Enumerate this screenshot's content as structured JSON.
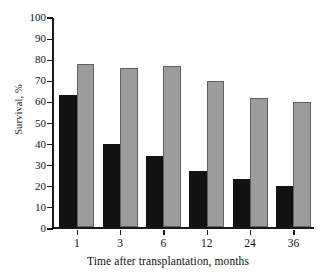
{
  "chart_data": {
    "type": "bar",
    "title": "",
    "xlabel": "Time after transplantation, months",
    "ylabel": "Survival, %",
    "categories": [
      "1",
      "3",
      "6",
      "12",
      "24",
      "36"
    ],
    "series": [
      {
        "name": "dark",
        "color": "#121212",
        "values": [
          63,
          40,
          34,
          27,
          23,
          20
        ]
      },
      {
        "name": "light",
        "color": "#9b9c9b",
        "values": [
          78,
          76,
          77,
          70,
          62,
          60
        ]
      }
    ],
    "ylim": [
      0,
      100
    ],
    "yticks": [
      100,
      90,
      80,
      70,
      60,
      50,
      40,
      30,
      20,
      10,
      0
    ],
    "ytick_labels": [
      "100",
      "90",
      "80",
      "70",
      "60",
      "50",
      "40",
      "30",
      "20",
      "10",
      "0"
    ],
    "grid": false,
    "legend": "none"
  }
}
